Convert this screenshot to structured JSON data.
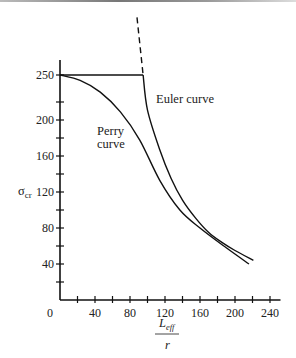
{
  "chart_data": {
    "type": "line",
    "title": "",
    "xlabel": "L_eff / r",
    "xlabel_numerator": "L",
    "xlabel_subscript": "eff",
    "xlabel_denominator": "r",
    "ylabel": "σ",
    "ylabel_subscript": "cr",
    "xlim": [
      0,
      240
    ],
    "ylim": [
      0,
      250
    ],
    "x_ticks": [
      20,
      40,
      60,
      80,
      100,
      120,
      140,
      160,
      180,
      200,
      220,
      240
    ],
    "x_tick_labels": [
      {
        "value": 0,
        "label": "0"
      },
      {
        "value": 40,
        "label": "40"
      },
      {
        "value": 80,
        "label": "80"
      },
      {
        "value": 120,
        "label": "120"
      },
      {
        "value": 160,
        "label": "160"
      },
      {
        "value": 200,
        "label": "200"
      },
      {
        "value": 240,
        "label": "240"
      }
    ],
    "y_ticks": [
      20,
      40,
      60,
      80,
      100,
      120,
      140,
      160,
      180,
      200,
      220,
      250
    ],
    "y_tick_labels": [
      {
        "value": 40,
        "label": "40"
      },
      {
        "value": 80,
        "label": "80"
      },
      {
        "value": 120,
        "label": "120"
      },
      {
        "value": 160,
        "label": "160"
      },
      {
        "value": 200,
        "label": "200"
      },
      {
        "value": 250,
        "label": "250"
      }
    ],
    "grid": false,
    "legend": "none (inline labels)",
    "series": [
      {
        "name": "Yield plateau",
        "style": "solid",
        "x": [
          0,
          95
        ],
        "values": [
          250,
          250
        ]
      },
      {
        "name": "Euler curve",
        "label": "Euler curve",
        "style": "solid",
        "x": [
          95,
          100,
          114,
          127,
          140,
          155,
          170,
          185,
          200,
          221
        ],
        "values": [
          250,
          211,
          167,
          135,
          111,
          91,
          75,
          64,
          55,
          44
        ]
      },
      {
        "name": "Euler curve (extension)",
        "style": "dashed",
        "x": [
          88,
          95
        ],
        "values": [
          314,
          250
        ]
      },
      {
        "name": "Perry curve",
        "label": "Perry curve",
        "label_lines": [
          "Perry",
          "curve"
        ],
        "style": "solid",
        "x": [
          0,
          23,
          46,
          69,
          91,
          114,
          137,
          160,
          190,
          216
        ],
        "values": [
          250,
          244,
          231,
          209,
          178,
          133,
          100,
          80,
          58,
          40
        ]
      }
    ],
    "annotations": [
      {
        "text": "Euler curve",
        "x": 105,
        "y": 223
      },
      {
        "text": "Perry curve",
        "x": 43,
        "y": 182
      }
    ]
  }
}
